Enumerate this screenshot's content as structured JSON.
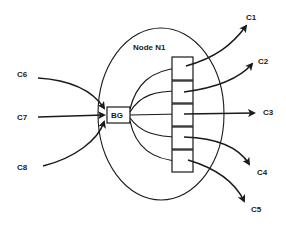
{
  "diagram": {
    "node": {
      "label": "Node N1"
    },
    "buffer": {
      "label": "BG"
    },
    "inputs": [
      {
        "id": "C6",
        "label": "C6"
      },
      {
        "id": "C7",
        "label": "C7"
      },
      {
        "id": "C8",
        "label": "C8"
      }
    ],
    "outputs": [
      {
        "id": "C1",
        "label": "C1"
      },
      {
        "id": "C2",
        "label": "C2"
      },
      {
        "id": "C3",
        "label": "C3"
      },
      {
        "id": "C4",
        "label": "C4"
      },
      {
        "id": "C5",
        "label": "C5"
      }
    ],
    "queue_cells": 5,
    "colors": {
      "stroke": "#1a1a1a",
      "background": "#ffffff"
    }
  }
}
